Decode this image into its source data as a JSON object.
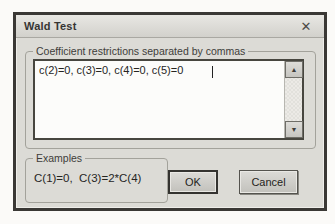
{
  "dialog": {
    "title": "Wald Test",
    "restrictions_group": {
      "label": "Coefficient restrictions separated by commas",
      "input_value": "c(2)=0, c(3)=0, c(4)=0, c(5)=0"
    },
    "examples_group": {
      "label": "Examples",
      "text": "C(1)=0,  C(3)=2*C(4)"
    },
    "buttons": {
      "ok": "OK",
      "cancel": "Cancel"
    },
    "icons": {
      "close": "✕",
      "scroll_up": "▲",
      "scroll_down": "▼"
    },
    "colors": {
      "dialog_bg": "#dcdbd6",
      "dialog_border": "#3a3835",
      "input_bg": "#fcfcfa",
      "text": "#26251f"
    }
  }
}
